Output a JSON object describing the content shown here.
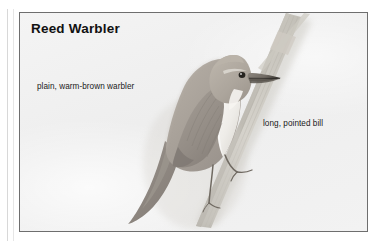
{
  "plate": {
    "title": "Reed Warbler",
    "background_color": "#f0f0f0",
    "border_color": "#6e6e6e",
    "annotations": [
      {
        "name": "plumage",
        "text": "plain, warm-brown warbler"
      },
      {
        "name": "bill",
        "text": "long, pointed bill"
      }
    ],
    "illustration": {
      "subject": "reed-warbler-perched-on-reed-stem",
      "description": "A plain warm-brown warbler perched facing right on a diagonal reed stem, pale whitish underparts, dark eye and long pointed bill",
      "colors": {
        "upperparts": "#a9a29a",
        "underparts": "#f2f0ec",
        "crown": "#b3aca2",
        "wing": "#9a938b",
        "tail": "#8e8880",
        "bill": "#6f6a63",
        "bill_tip": "#3a3833",
        "eye": "#262420",
        "leg": "#8a8378",
        "reed_stem": "#c9c6bf",
        "reed_stem_shadow": "#b4b0a8"
      }
    }
  }
}
